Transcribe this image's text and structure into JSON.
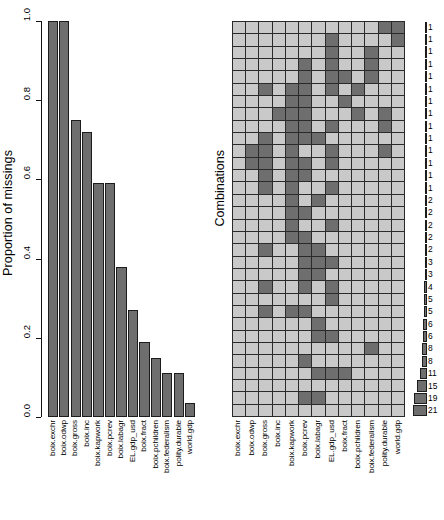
{
  "chart_data": {
    "type": "bar",
    "title": "",
    "panels": [
      {
        "name": "proportion-of-missings",
        "type": "bar",
        "ylabel": "Proportion of missings",
        "xlabel": "",
        "ylim": [
          0.0,
          1.0
        ],
        "yticks": [
          "0.0",
          "0.2",
          "0.4",
          "0.6",
          "0.8",
          "1.0"
        ],
        "ytick_values": [
          0.0,
          0.2,
          0.4,
          0.6,
          0.8,
          1.0
        ],
        "grid": false,
        "categories": [
          "boix.exchr",
          "boix.odwp",
          "boix.gross",
          "boix.inc",
          "boix.kapwork",
          "boix.pcrev",
          "boix.labagr",
          "EL.gdp_usd",
          "boix.fract",
          "boix.pchildren",
          "boix.federalism",
          "polity.durable",
          "world.gdp"
        ],
        "values": [
          1.0,
          1.0,
          0.75,
          0.72,
          0.59,
          0.59,
          0.38,
          0.27,
          0.19,
          0.15,
          0.11,
          0.11,
          0.035
        ]
      },
      {
        "name": "combinations-matrix",
        "type": "heatmap",
        "ylabel": "Combinations",
        "xlabel": "",
        "categories": [
          "boix.exchr",
          "boix.odwp",
          "boix.gross",
          "boix.inc",
          "boix.kapwork",
          "boix.pcrev",
          "boix.labagr",
          "EL.gdp_usd",
          "boix.fract",
          "boix.pchildren",
          "boix.federalism",
          "polity.durable",
          "world.gdp"
        ],
        "legend": {
          "missing_color": "#6e6e6e",
          "observed_color": "#c9c9c9"
        },
        "counts": [
          1,
          1,
          1,
          1,
          1,
          1,
          1,
          1,
          1,
          1,
          1,
          1,
          1,
          1,
          2,
          2,
          2,
          2,
          2,
          3,
          3,
          4,
          5,
          5,
          6,
          6,
          8,
          8,
          11,
          15,
          19,
          21
        ],
        "rows": [
          [
            1,
            1,
            1,
            1,
            1,
            1,
            1,
            1,
            1,
            1,
            1,
            0,
            0
          ],
          [
            1,
            1,
            1,
            1,
            1,
            1,
            1,
            0,
            1,
            1,
            1,
            1,
            0
          ],
          [
            1,
            1,
            1,
            1,
            1,
            1,
            1,
            0,
            1,
            1,
            0,
            1,
            1
          ],
          [
            1,
            1,
            1,
            1,
            1,
            0,
            1,
            0,
            1,
            1,
            0,
            1,
            1
          ],
          [
            1,
            1,
            1,
            1,
            1,
            0,
            1,
            0,
            0,
            1,
            0,
            1,
            1
          ],
          [
            1,
            1,
            0,
            1,
            0,
            0,
            1,
            0,
            1,
            0,
            1,
            1,
            1
          ],
          [
            1,
            1,
            1,
            1,
            0,
            0,
            1,
            1,
            0,
            1,
            1,
            1,
            1
          ],
          [
            1,
            1,
            1,
            0,
            0,
            0,
            1,
            1,
            1,
            0,
            1,
            0,
            1
          ],
          [
            1,
            1,
            1,
            1,
            0,
            0,
            1,
            0,
            1,
            1,
            1,
            0,
            1
          ],
          [
            1,
            1,
            0,
            1,
            0,
            0,
            0,
            1,
            1,
            1,
            1,
            1,
            1
          ],
          [
            1,
            0,
            0,
            1,
            0,
            1,
            1,
            0,
            1,
            1,
            1,
            0,
            1
          ],
          [
            1,
            0,
            0,
            1,
            0,
            0,
            1,
            0,
            1,
            1,
            1,
            1,
            1
          ],
          [
            1,
            1,
            0,
            1,
            0,
            0,
            1,
            1,
            1,
            1,
            1,
            1,
            1
          ],
          [
            1,
            1,
            0,
            1,
            0,
            1,
            1,
            0,
            1,
            1,
            1,
            1,
            1
          ],
          [
            1,
            1,
            1,
            1,
            0,
            1,
            0,
            1,
            1,
            1,
            1,
            1,
            1
          ],
          [
            1,
            1,
            1,
            1,
            0,
            0,
            1,
            1,
            1,
            1,
            1,
            1,
            1
          ],
          [
            1,
            1,
            1,
            1,
            0,
            1,
            1,
            0,
            1,
            1,
            1,
            1,
            1
          ],
          [
            1,
            1,
            1,
            1,
            0,
            0,
            1,
            1,
            1,
            1,
            1,
            1,
            1
          ],
          [
            1,
            1,
            0,
            1,
            1,
            0,
            0,
            1,
            1,
            1,
            1,
            1,
            1
          ],
          [
            1,
            1,
            1,
            1,
            1,
            0,
            0,
            0,
            1,
            1,
            1,
            1,
            1
          ],
          [
            1,
            1,
            1,
            1,
            1,
            0,
            0,
            1,
            1,
            1,
            1,
            1,
            1
          ],
          [
            1,
            1,
            0,
            1,
            1,
            0,
            1,
            0,
            1,
            1,
            1,
            1,
            1
          ],
          [
            1,
            1,
            1,
            1,
            1,
            1,
            1,
            0,
            1,
            1,
            1,
            1,
            1
          ],
          [
            1,
            1,
            0,
            1,
            0,
            0,
            1,
            1,
            1,
            1,
            1,
            1,
            1
          ],
          [
            1,
            1,
            1,
            1,
            1,
            1,
            0,
            1,
            1,
            1,
            1,
            1,
            1
          ],
          [
            1,
            1,
            1,
            1,
            1,
            1,
            0,
            0,
            1,
            1,
            1,
            1,
            1
          ],
          [
            1,
            1,
            1,
            1,
            1,
            1,
            1,
            1,
            1,
            1,
            0,
            1,
            1
          ],
          [
            1,
            1,
            1,
            1,
            1,
            0,
            1,
            1,
            1,
            1,
            1,
            1,
            1
          ],
          [
            1,
            1,
            1,
            1,
            1,
            1,
            0,
            0,
            0,
            1,
            1,
            1,
            1
          ],
          [
            1,
            1,
            1,
            1,
            1,
            1,
            1,
            1,
            1,
            1,
            1,
            1,
            1
          ],
          [
            1,
            1,
            1,
            1,
            1,
            0,
            0,
            1,
            1,
            1,
            1,
            1,
            1
          ],
          [
            1,
            1,
            1,
            1,
            1,
            1,
            1,
            1,
            1,
            1,
            1,
            1,
            1
          ]
        ]
      }
    ]
  }
}
